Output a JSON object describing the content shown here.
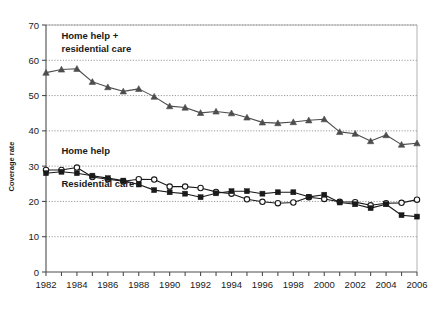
{
  "chart_data": {
    "type": "line",
    "title": "",
    "xlabel": "",
    "ylabel": "Coverage rate",
    "xlim": [
      1982,
      2006
    ],
    "ylim": [
      0,
      70
    ],
    "ytick_step": 10,
    "yticks": [
      0,
      10,
      20,
      30,
      40,
      50,
      60,
      70
    ],
    "xticks_labeled": [
      1982,
      1984,
      1986,
      1988,
      1990,
      1992,
      1994,
      1996,
      1998,
      2000,
      2002,
      2004,
      2006
    ],
    "x": [
      1982,
      1983,
      1984,
      1985,
      1986,
      1987,
      1988,
      1989,
      1990,
      1991,
      1992,
      1993,
      1994,
      1995,
      1996,
      1997,
      1998,
      1999,
      2000,
      2001,
      2002,
      2003,
      2004,
      2005,
      2006
    ],
    "grid": "horizontal-dotted",
    "legend_position": "inline-annotations",
    "series": [
      {
        "name": "Home help + residential care",
        "marker": "triangle",
        "color": "#4d4d4d",
        "values": [
          56.5,
          57.4,
          57.6,
          53.9,
          52.4,
          51.2,
          51.9,
          49.7,
          47.0,
          46.6,
          45.1,
          45.5,
          45.0,
          43.8,
          42.4,
          42.2,
          42.5,
          43.0,
          43.3,
          39.7,
          39.2,
          37.1,
          38.8,
          36.1,
          36.5
        ]
      },
      {
        "name": "Home help",
        "marker": "circle-open",
        "color": "#1a1a1a",
        "values": [
          28.9,
          28.9,
          29.6,
          26.9,
          26.3,
          25.7,
          26.3,
          26.2,
          24.2,
          24.2,
          23.8,
          22.7,
          22.2,
          20.6,
          19.9,
          19.5,
          19.7,
          21.2,
          20.7,
          19.9,
          19.8,
          18.9,
          19.5,
          19.6,
          20.5
        ]
      },
      {
        "name": "Residential care",
        "marker": "square-filled",
        "color": "#1a1a1a",
        "values": [
          28.0,
          28.4,
          28.0,
          27.3,
          26.6,
          25.9,
          24.8,
          23.2,
          22.6,
          22.2,
          21.2,
          22.3,
          22.9,
          22.9,
          22.2,
          22.6,
          22.6,
          21.3,
          21.9,
          19.7,
          19.2,
          18.1,
          19.2,
          16.1,
          15.7
        ]
      }
    ],
    "annotations": [
      {
        "id": "annotation-top-series",
        "lines": [
          "Home help +",
          "residential care"
        ],
        "x": 1983.0,
        "y": 66.0
      },
      {
        "id": "annotation-home-help",
        "lines": [
          "Home help"
        ],
        "x": 1983.0,
        "y": 33.5
      },
      {
        "id": "annotation-residential-care",
        "lines": [
          "Residential care"
        ],
        "x": 1983.0,
        "y": 24.0
      }
    ]
  },
  "axis": {
    "y_title": "Coverage rate"
  }
}
